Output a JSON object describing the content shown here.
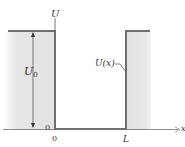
{
  "diagram": {
    "type": "potential-well",
    "axis_labels": {
      "y_axis": "U",
      "x_axis": "x"
    },
    "tick_labels": {
      "y_zero": "0",
      "x_zero": "0",
      "x_L": "L"
    },
    "height_label": {
      "symbol": "U",
      "subscript": "0"
    },
    "curve_label": "U(x)",
    "colors": {
      "shading": "#e6e6e6",
      "line": "#6e6e6e",
      "text": "#333333"
    }
  }
}
